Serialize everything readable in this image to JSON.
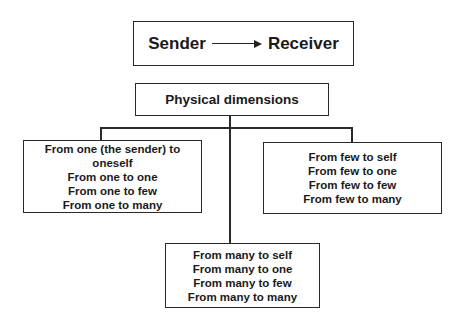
{
  "header": {
    "sender": "Sender",
    "receiver": "Receiver"
  },
  "root": {
    "label": "Physical dimensions"
  },
  "branches": {
    "one": {
      "lines": [
        "From one (the sender) to",
        "oneself",
        "From one to one",
        "From one to few",
        "From one to many"
      ]
    },
    "few": {
      "lines": [
        "From few to self",
        "From few to one",
        "From few to few",
        "From few to many"
      ]
    },
    "many": {
      "lines": [
        "From many to self",
        "From many to one",
        "From many to few",
        "From many to many"
      ]
    }
  }
}
